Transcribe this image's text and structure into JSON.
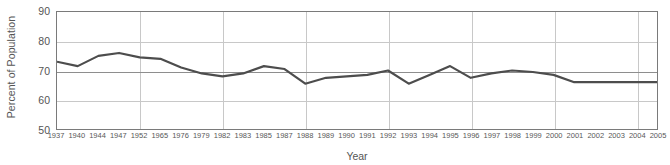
{
  "chart_data": {
    "type": "line",
    "title": "",
    "xlabel": "Year",
    "ylabel": "Percent of Population",
    "ylim": [
      50,
      90
    ],
    "yticks": [
      50,
      60,
      70,
      80,
      90
    ],
    "grid": true,
    "legend": null,
    "reference_line": 70,
    "line_color": "#4d4d4d",
    "grid_color": "#c8c8c8",
    "axis_color": "#7a7a7a",
    "categories": [
      "1937",
      "1940",
      "1944",
      "1947",
      "1952",
      "1965",
      "1976",
      "1979",
      "1982",
      "1983",
      "1985",
      "1987",
      "1988",
      "1989",
      "1990",
      "1991",
      "1992",
      "1993",
      "1994",
      "1995",
      "1996",
      "1997",
      "1998",
      "1999",
      "2000",
      "2001",
      "2002",
      "2003",
      "2004",
      "2005"
    ],
    "values": [
      73,
      71.5,
      75,
      76,
      74.5,
      74,
      71,
      69,
      68,
      69,
      71.5,
      70.5,
      65.5,
      67.5,
      68,
      68.5,
      70,
      65.5,
      68.5,
      71.5,
      67.5,
      69,
      70,
      69.5,
      68.5,
      66,
      66,
      66,
      66,
      66
    ],
    "series": [
      {
        "name": "Percent of Population",
        "values": [
          73,
          71.5,
          75,
          76,
          74.5,
          74,
          71,
          69,
          68,
          69,
          71.5,
          70.5,
          65.5,
          67.5,
          68,
          68.5,
          70,
          65.5,
          68.5,
          71.5,
          67.5,
          69,
          70,
          69.5,
          68.5,
          66,
          66,
          66,
          66,
          66
        ]
      }
    ]
  }
}
